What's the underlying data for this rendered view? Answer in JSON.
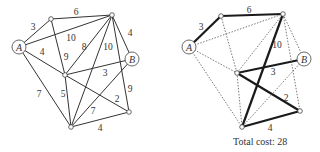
{
  "left_graph": {
    "title": "",
    "nodes": [
      {
        "id": "A",
        "label": "A",
        "x": 19,
        "y": 47,
        "named": true
      },
      {
        "id": "N1",
        "label": "",
        "x": 51,
        "y": 19,
        "named": false
      },
      {
        "id": "N2",
        "label": "",
        "x": 112,
        "y": 15,
        "named": false
      },
      {
        "id": "B",
        "label": "B",
        "x": 132,
        "y": 59,
        "named": true
      },
      {
        "id": "C",
        "label": "",
        "x": 65,
        "y": 75,
        "named": false
      },
      {
        "id": "D",
        "label": "",
        "x": 129,
        "y": 112,
        "named": false
      },
      {
        "id": "E",
        "label": "",
        "x": 71,
        "y": 127,
        "named": false
      }
    ],
    "edges": [
      {
        "from": "A",
        "to": "N1",
        "weight": "3",
        "lx": 33,
        "ly": 30
      },
      {
        "from": "N1",
        "to": "N2",
        "weight": "6",
        "lx": 76,
        "ly": 15
      },
      {
        "from": "A",
        "to": "N2",
        "weight": "10",
        "lx": 71,
        "ly": 41
      },
      {
        "from": "A",
        "to": "C",
        "weight": "4",
        "lx": 42,
        "ly": 55
      },
      {
        "from": "N1",
        "to": "C",
        "weight": "9",
        "lx": 66,
        "ly": 60
      },
      {
        "from": "C",
        "to": "N2",
        "weight": "8",
        "lx": 84,
        "ly": 50
      },
      {
        "from": "N2",
        "to": "E",
        "weight": "10",
        "lx": 108,
        "ly": 50
      },
      {
        "from": "N2",
        "to": "B",
        "weight": "4",
        "lx": 130,
        "ly": 36
      },
      {
        "from": "C",
        "to": "B",
        "weight": "3",
        "lx": 105,
        "ly": 76
      },
      {
        "from": "N2",
        "to": "D",
        "weight": "9",
        "lx": 130,
        "ly": 92
      },
      {
        "from": "C",
        "to": "D",
        "weight": "2",
        "lx": 117,
        "ly": 102
      },
      {
        "from": "A",
        "to": "E",
        "weight": "7",
        "lx": 39,
        "ly": 97
      },
      {
        "from": "C",
        "to": "E",
        "weight": "5",
        "lx": 63,
        "ly": 97
      },
      {
        "from": "B",
        "to": "E",
        "weight": "7",
        "lx": 93,
        "ly": 114
      },
      {
        "from": "E",
        "to": "D",
        "weight": "4",
        "lx": 100,
        "ly": 131
      }
    ]
  },
  "right_graph": {
    "nodes": [
      {
        "id": "A",
        "label": "A",
        "x": 189,
        "y": 47,
        "named": true
      },
      {
        "id": "N1",
        "label": "",
        "x": 221,
        "y": 16,
        "named": false
      },
      {
        "id": "N2",
        "label": "",
        "x": 283,
        "y": 14,
        "named": false
      },
      {
        "id": "B",
        "label": "B",
        "x": 304,
        "y": 59,
        "named": true
      },
      {
        "id": "C",
        "label": "",
        "x": 237,
        "y": 73,
        "named": false
      },
      {
        "id": "D",
        "label": "",
        "x": 300,
        "y": 111,
        "named": false
      },
      {
        "id": "E",
        "label": "",
        "x": 242,
        "y": 127,
        "named": false
      }
    ],
    "edges": [
      {
        "from": "A",
        "to": "N1",
        "weight": "3",
        "bold": true,
        "lx": 201,
        "ly": 30
      },
      {
        "from": "N1",
        "to": "N2",
        "weight": "6",
        "bold": true,
        "lx": 249,
        "ly": 13
      },
      {
        "from": "A",
        "to": "N2",
        "weight": "",
        "bold": false
      },
      {
        "from": "A",
        "to": "C",
        "weight": "",
        "bold": false
      },
      {
        "from": "N1",
        "to": "C",
        "weight": "",
        "bold": false
      },
      {
        "from": "C",
        "to": "N2",
        "weight": "",
        "bold": false
      },
      {
        "from": "N2",
        "to": "E",
        "weight": "10",
        "bold": true,
        "lx": 277,
        "ly": 48
      },
      {
        "from": "N2",
        "to": "B",
        "weight": "",
        "bold": false
      },
      {
        "from": "C",
        "to": "B",
        "weight": "3",
        "bold": true,
        "lx": 273,
        "ly": 75
      },
      {
        "from": "N2",
        "to": "D",
        "weight": "",
        "bold": false
      },
      {
        "from": "C",
        "to": "D",
        "weight": "2",
        "bold": true,
        "lx": 286,
        "ly": 101
      },
      {
        "from": "A",
        "to": "E",
        "weight": "",
        "bold": false
      },
      {
        "from": "C",
        "to": "E",
        "weight": "",
        "bold": false
      },
      {
        "from": "B",
        "to": "E",
        "weight": "",
        "bold": false
      },
      {
        "from": "E",
        "to": "D",
        "weight": "4",
        "bold": true,
        "lx": 270,
        "ly": 131
      }
    ]
  },
  "caption": "Total cost: 28",
  "colors": {
    "edge": "#333333",
    "bold_edge": "#1a1a1a",
    "dashed_edge": "#555555",
    "node_fill": "#ffffff",
    "node_stroke": "#444444"
  }
}
